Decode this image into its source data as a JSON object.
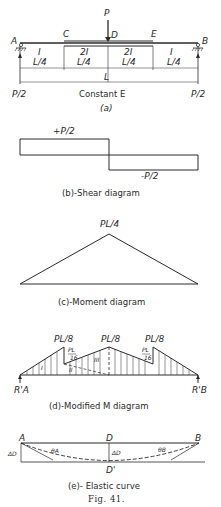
{
  "figure": {
    "number_label": "Fig. 41.",
    "panel_a": {
      "caption": "(a)",
      "load_label": "P",
      "points": {
        "A": "A",
        "B": "B",
        "C": "C",
        "D": "D",
        "E": "E"
      },
      "segment_inertia": [
        "I",
        "2I",
        "2I",
        "I"
      ],
      "segment_lengths": [
        "L/4",
        "L/4",
        "L/4",
        "L/4"
      ],
      "span_label": "L",
      "reaction_left": "P/2",
      "reaction_right": "P/2",
      "material_note": "Constant E"
    },
    "panel_b": {
      "caption": "(b)-Shear diagram",
      "positive_label": "+P/2",
      "negative_label": "-P/2"
    },
    "panel_c": {
      "caption": "(c)-Moment diagram",
      "peak_label": "PL/4"
    },
    "panel_d": {
      "caption": "(d)-Modified M diagram",
      "peak_left": "PL/8",
      "peak_mid": "PL/8",
      "peak_right": "PL/8",
      "step_left_num": "PL",
      "step_left_den": "16",
      "step_right_num": "PL",
      "step_right_den": "16",
      "region_labels": [
        "I",
        "II",
        "III"
      ],
      "reaction_left": "R'A",
      "reaction_right": "R'B"
    },
    "panel_e": {
      "caption": "(e)- Elastic curve",
      "point_A": "A",
      "point_D": "D",
      "point_B": "B",
      "point_D_prime": "D'",
      "delta_left": "ΔD",
      "delta_mid": "ΔD",
      "theta_A": "θA",
      "theta_B": "θB"
    }
  }
}
